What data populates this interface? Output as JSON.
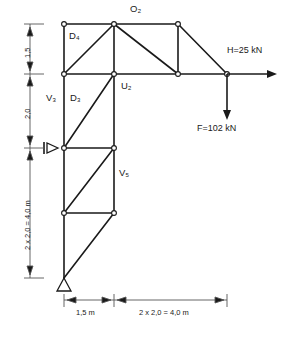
{
  "figure": {
    "kind": "truss-structural-diagram",
    "title": "",
    "line_color": "#1a1a1a",
    "dimension_color": "#555555",
    "node_fill": "#ffffff",
    "background": "#ffffff"
  },
  "member_labels": [
    {
      "name": "O2",
      "base": "O",
      "sub": "2",
      "text": "O₂",
      "x": 130,
      "y": 9
    },
    {
      "name": "D4",
      "base": "D",
      "sub": "4",
      "text": "D₄",
      "x": 70,
      "y": 33
    },
    {
      "name": "U2",
      "base": "U",
      "sub": "2",
      "text": "U₂",
      "x": 122,
      "y": 85
    },
    {
      "name": "V3",
      "base": "V",
      "sub": "3",
      "text": "V₃",
      "x": 47,
      "y": 97
    },
    {
      "name": "D3",
      "base": "D",
      "sub": "3",
      "text": "D₃",
      "x": 71,
      "y": 97
    },
    {
      "name": "V5",
      "base": "V",
      "sub": "5",
      "text": "V₅",
      "x": 120,
      "y": 172
    }
  ],
  "loads": [
    {
      "name": "horizontal-load",
      "text": "H=25 kN",
      "value": 25,
      "unit": "kN",
      "symbol": "H",
      "direction": "right",
      "x": 228,
      "y": 52
    },
    {
      "name": "vertical-load",
      "text": "F=102 kN",
      "value": 102,
      "unit": "kN",
      "symbol": "F",
      "direction": "down",
      "x": 198,
      "y": 128
    }
  ],
  "vertical_dimensions": [
    {
      "name": "dim-top-1-5",
      "text": "1,5",
      "value": 1.5,
      "from_y": 24,
      "to_y": 74
    },
    {
      "name": "dim-mid-2-0",
      "text": "2,0",
      "value": 2.0,
      "from_y": 74,
      "to_y": 148
    },
    {
      "name": "dim-bottom-4-0",
      "text": "2 x 2,0 = 4,0 m",
      "value": 4.0,
      "from_y": 148,
      "to_y": 278
    }
  ],
  "horizontal_dimensions": [
    {
      "name": "dim-span-1-5m",
      "text": "1,5 m",
      "value": 1.5,
      "from_x": 64,
      "to_x": 114
    },
    {
      "name": "dim-span-4-0m",
      "text": "2 x 2,0 = 4,0 m",
      "value": 4.0,
      "from_x": 114,
      "to_x": 227
    }
  ],
  "supports": [
    {
      "name": "roller-support-horizontal",
      "type": "horizontal-roller",
      "x": 64,
      "y": 148
    },
    {
      "name": "pin-support-base",
      "type": "pinned",
      "x": 64,
      "y": 278
    }
  ],
  "geometry": {
    "nodes": [
      {
        "id": "n1",
        "x": 64,
        "y": 24
      },
      {
        "id": "n2",
        "x": 114,
        "y": 24
      },
      {
        "id": "n3",
        "x": 178,
        "y": 24
      },
      {
        "id": "n4",
        "x": 64,
        "y": 74
      },
      {
        "id": "n5",
        "x": 114,
        "y": 74
      },
      {
        "id": "n6",
        "x": 178,
        "y": 74
      },
      {
        "id": "n7",
        "x": 227,
        "y": 74
      },
      {
        "id": "n8",
        "x": 64,
        "y": 148
      },
      {
        "id": "n9",
        "x": 114,
        "y": 148
      },
      {
        "id": "n10",
        "x": 64,
        "y": 213
      },
      {
        "id": "n11",
        "x": 114,
        "y": 213
      },
      {
        "id": "n12",
        "x": 64,
        "y": 278
      }
    ]
  }
}
